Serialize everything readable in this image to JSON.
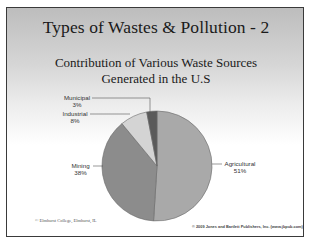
{
  "slide": {
    "title": "Types of Wastes & Pollution - 2",
    "subtitle_line1": "Contribution of Various Waste Sources",
    "subtitle_line2": "Generated in the U.S",
    "footer_left": "© Elmhurst College, Elmhurst, IL",
    "footer_right": "© 2009 Jones and Bartlett Publishers, Inc. (www.jbpub.com)"
  },
  "labels": {
    "municipal_name": "Municipal",
    "municipal_pct": "3%",
    "industrial_name": "Industrial",
    "industrial_pct": "8%",
    "mining_name": "Mining",
    "mining_pct": "38%",
    "agricultural_name": "Agricultural",
    "agricultural_pct": "51%"
  },
  "chart_data": {
    "type": "pie",
    "title": "Contribution of Various Waste Sources Generated in the U.S",
    "categories": [
      "Agricultural",
      "Mining",
      "Industrial",
      "Municipal"
    ],
    "values": [
      51,
      38,
      8,
      3
    ],
    "unit": "%",
    "colors": [
      "#a9a9a9",
      "#8c8c8c",
      "#d4d4d4",
      "#5a5a5a"
    ],
    "legend": "none (leader-line data labels)"
  }
}
